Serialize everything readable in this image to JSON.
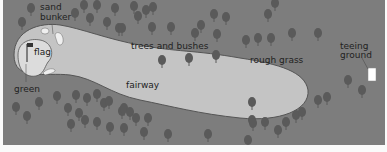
{
  "diagram": {
    "labels": {
      "sand_bunker_line1": "sand",
      "sand_bunker_line2": "bunker",
      "flag": "flag",
      "green": "green",
      "trees_and_bushes": "trees and bushes",
      "fairway": "fairway",
      "rough_grass": "rough grass",
      "teeing_ground_line1": "teeing",
      "teeing_ground_line2": "ground"
    },
    "colors": {
      "rough": "#7d7d7d",
      "fairway": "#c4c4c4",
      "green": "#dcdcdc",
      "bunker": "#efefef",
      "tree": "#5a5a5a",
      "tee": "#ffffff",
      "background": "#fafafa"
    }
  }
}
